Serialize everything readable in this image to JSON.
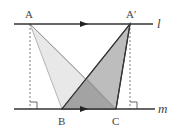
{
  "diagram": {
    "points": {
      "A": {
        "label": "A",
        "x": 30,
        "y": 24
      },
      "A_prime": {
        "label": "A′",
        "x": 130,
        "y": 24
      },
      "B": {
        "label": "B",
        "x": 62,
        "y": 109
      },
      "C": {
        "label": "C",
        "x": 116,
        "y": 109
      }
    },
    "lines": {
      "l": {
        "label": "l"
      },
      "m": {
        "label": "m"
      }
    },
    "colors": {
      "line": "#333333",
      "triangle_ABC_fill": "#e6e6e6",
      "triangle_ApBC_fill": "#b8b8b8",
      "overlap_fill": "#a0a0a0",
      "light_edge": "#b0b0b0"
    }
  }
}
